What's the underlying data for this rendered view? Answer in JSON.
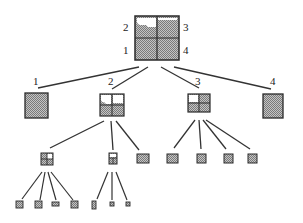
{
  "diagram": {
    "type": "quadtree",
    "colors": {
      "fill": "#a8a8a8",
      "stroke": "#2a2a2a",
      "empty": "#ffffff",
      "line": "#333333"
    },
    "root": {
      "quadrant_labels": {
        "nw": "2",
        "ne": "3",
        "sw": "1",
        "se": "4"
      }
    },
    "level1_labels": [
      "1",
      "2",
      "3",
      "4"
    ]
  }
}
